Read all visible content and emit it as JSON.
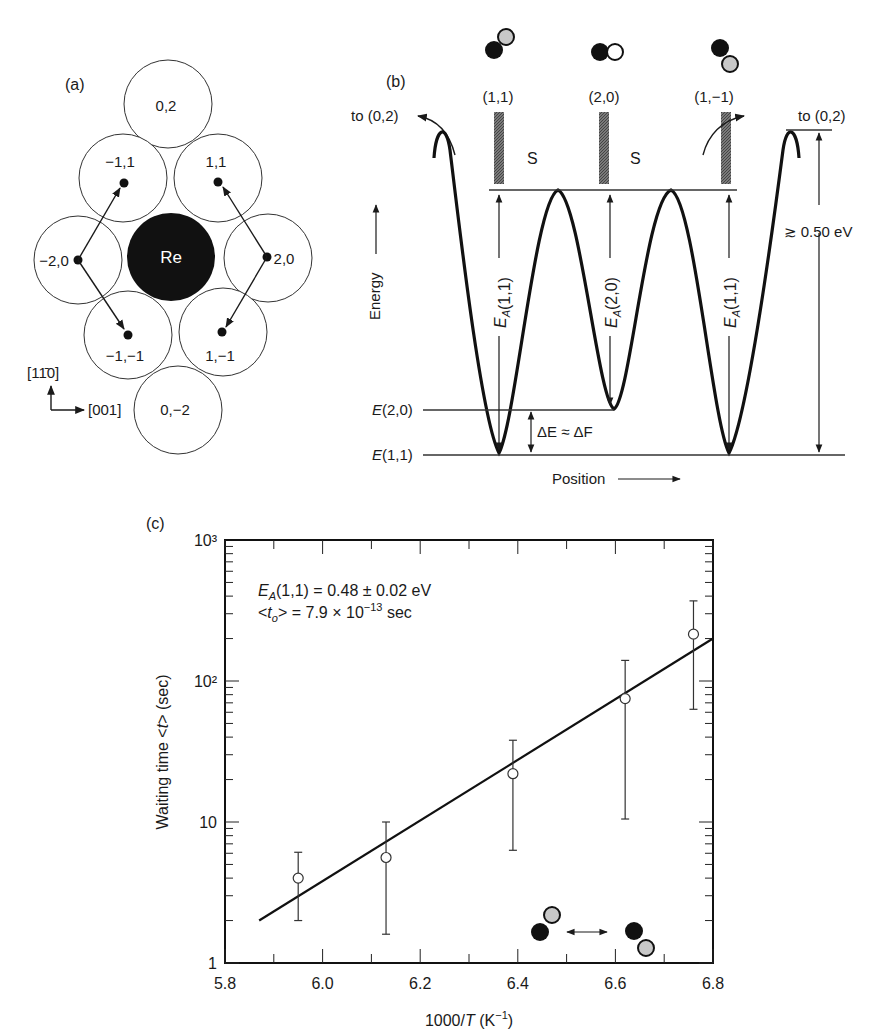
{
  "panel_a": {
    "label": "(a)",
    "center_atom": "Re",
    "sites": [
      {
        "id": "0,2",
        "label": "0,2"
      },
      {
        "id": "-1,1",
        "label": "−1,1"
      },
      {
        "id": "1,1",
        "label": "1,1"
      },
      {
        "id": "-2,0",
        "label": "−2,0"
      },
      {
        "id": "2,0",
        "label": "2,0"
      },
      {
        "id": "-1,-1",
        "label": "−1,−1"
      },
      {
        "id": "1,-1",
        "label": "1,−1"
      },
      {
        "id": "0,-2",
        "label": "0,−2"
      }
    ],
    "axis_up": "[11̄0]",
    "axis_right": "[001]"
  },
  "panel_b": {
    "label": "(b)",
    "configs": [
      "(1,1)",
      "(2,0)",
      "(1,−1)"
    ],
    "saddle_label": "S",
    "to_label": "to (0,2)",
    "ylabel": "Energy",
    "xlabel": "Position",
    "barrier_labels": [
      "E_A(1,1)",
      "E_A(2,0)",
      "E_A(1,1)"
    ],
    "level_e20": "E(2,0)",
    "level_e11": "E(1,1)",
    "delta_label": "ΔE ≈ ΔF",
    "outer_barrier": "≳ 0.50 eV"
  },
  "chart_data": {
    "type": "scatter",
    "panel_label": "(c)",
    "title": "",
    "xlabel": "1000/T (K⁻¹)",
    "ylabel": "Waiting time <t> (sec)",
    "xlim": [
      5.8,
      6.8
    ],
    "ylim": [
      1,
      1000
    ],
    "yscale": "log",
    "x_ticks": [
      "5.8",
      "6.0",
      "6.2",
      "6.4",
      "6.6",
      "6.8"
    ],
    "y_ticks": [
      "1",
      "10",
      "10²",
      "10³"
    ],
    "grid": false,
    "annotation_line1": "E_A(1,1) = 0.48 ± 0.02 eV",
    "annotation_line2": "<t_o> = 7.9 × 10⁻¹³ sec",
    "series": [
      {
        "name": "measured",
        "marker": "open-circle",
        "x": [
          5.95,
          6.13,
          6.39,
          6.62,
          6.76
        ],
        "y": [
          4.0,
          5.6,
          22,
          75,
          215
        ],
        "err_low": [
          2.0,
          1.6,
          6.3,
          10.5,
          63
        ],
        "err_high": [
          6.1,
          10,
          38,
          140,
          370
        ]
      },
      {
        "name": "Arrhenius fit",
        "marker": "line",
        "x": [
          5.87,
          6.8
        ],
        "y": [
          2.0,
          200
        ]
      }
    ]
  }
}
